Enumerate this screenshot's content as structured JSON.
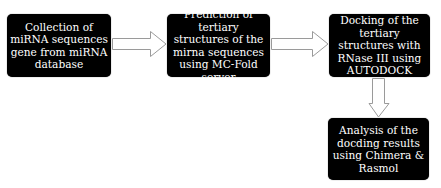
{
  "diagram": {
    "type": "flowchart",
    "colors": {
      "box_fill": "#000000",
      "box_text": "#ffffff",
      "arrow_fill": "#ffffff",
      "arrow_stroke": "#9a9a9a",
      "background": "#ffffff"
    },
    "steps": [
      {
        "id": "step1",
        "text": "Collection of miRNA sequences gene from miRNA database"
      },
      {
        "id": "step2",
        "text": "Prediction of tertiary structures of the mirna sequences using MC-Fold server"
      },
      {
        "id": "step3",
        "text": "Docking of the tertiary structures with RNase III using AUTODOCK"
      },
      {
        "id": "step4",
        "text": "Analysis of the docding results using Chimera & Rasmol"
      }
    ],
    "arrows": [
      {
        "from": "step1",
        "to": "step2",
        "direction": "right"
      },
      {
        "from": "step2",
        "to": "step3",
        "direction": "right"
      },
      {
        "from": "step3",
        "to": "step4",
        "direction": "down"
      }
    ]
  }
}
